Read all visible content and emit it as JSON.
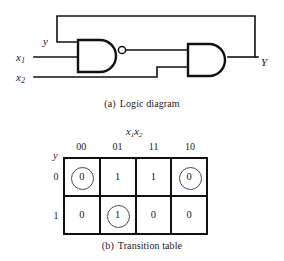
{
  "figures": [
    {
      "id": "logic-diagram",
      "caption_tag": "(a)",
      "caption_text": "Logic diagram",
      "signals": {
        "feedback_input": "y",
        "input_1_name": "x",
        "input_1_sub": "1",
        "input_2_name": "x",
        "input_2_sub": "2",
        "output": "Y"
      },
      "gates": [
        {
          "name": "nand-gate",
          "type": "NAND",
          "inputs": [
            "y",
            "x1"
          ],
          "inverted": true
        },
        {
          "name": "and-gate",
          "type": "AND",
          "inputs": [
            "nand-out",
            "x2"
          ],
          "inverted": false
        }
      ],
      "line_color": "#111111"
    },
    {
      "id": "transition-table",
      "caption_tag": "(b)",
      "caption_text": "Transition table",
      "col_group_var": "x",
      "col_group_sub_1": "1",
      "col_group_var_2": "x",
      "col_group_sub_2": "2",
      "row_var": "y",
      "col_headers": [
        "00",
        "01",
        "11",
        "10"
      ],
      "row_headers": [
        "0",
        "1"
      ],
      "rows": [
        {
          "label": "0",
          "cells": [
            {
              "value": "0",
              "stable": true
            },
            {
              "value": "1",
              "stable": false
            },
            {
              "value": "1",
              "stable": false
            },
            {
              "value": "0",
              "stable": true
            }
          ]
        },
        {
          "label": "1",
          "cells": [
            {
              "value": "0",
              "stable": false
            },
            {
              "value": "1",
              "stable": true
            },
            {
              "value": "0",
              "stable": false
            },
            {
              "value": "0",
              "stable": false
            }
          ]
        }
      ],
      "border_color": "#111111",
      "ring_color": "#4a4a4a"
    }
  ]
}
